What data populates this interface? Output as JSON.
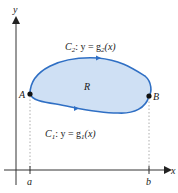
{
  "diagram": {
    "axes": {
      "x_label": "x",
      "y_label": "y"
    },
    "ticks": {
      "a": "a",
      "b": "b"
    },
    "points": {
      "A": "A",
      "B": "B"
    },
    "region_label": "R",
    "curves": {
      "upper": {
        "name": "C",
        "sub": "2",
        "eq": ": y = g",
        "eq_sub": "2",
        "eq_tail": "(x)"
      },
      "lower": {
        "name": "C",
        "sub": "1",
        "eq": ": y = g",
        "eq_sub": "1",
        "eq_tail": "(x)"
      }
    },
    "colors": {
      "fill": "#cfe0f4",
      "stroke": "#2f6fc4",
      "axis": "#333333"
    }
  }
}
